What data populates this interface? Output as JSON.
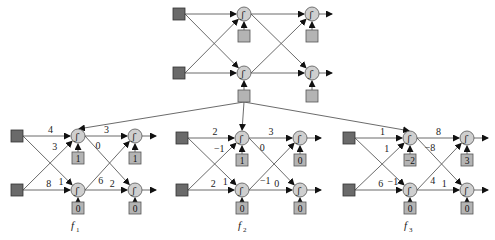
{
  "colors": {
    "edge": "#5a5a5a",
    "input_node": "#6a6a6a",
    "bias_node": "#b4b4b4",
    "neuron": "#cfcfcf",
    "arrow": "#111111"
  },
  "top_network": {
    "inputs": [
      {
        "x": 179,
        "y": 14
      },
      {
        "x": 179,
        "y": 73
      }
    ],
    "layer1": [
      {
        "x": 244,
        "y": 14
      },
      {
        "x": 244,
        "y": 73
      }
    ],
    "layer2": [
      {
        "x": 312,
        "y": 14
      },
      {
        "x": 312,
        "y": 73
      }
    ],
    "bias_l1": [
      {
        "x": 244,
        "y": 36,
        "label": ""
      },
      {
        "x": 244,
        "y": 96,
        "label": ""
      }
    ],
    "bias_l2": [
      {
        "x": 312,
        "y": 36,
        "label": ""
      },
      {
        "x": 312,
        "y": 96,
        "label": ""
      }
    ],
    "output_end_x": 332
  },
  "fanout_source": {
    "x": 244,
    "y": 96
  },
  "networks": [
    {
      "name": "f",
      "sub": "1",
      "label_pos": {
        "x": 74,
        "y": 229
      },
      "inputs": [
        {
          "x": 17,
          "y": 136
        },
        {
          "x": 17,
          "y": 190
        }
      ],
      "layer1": [
        {
          "x": 78,
          "y": 136
        },
        {
          "x": 78,
          "y": 190
        }
      ],
      "layer2": [
        {
          "x": 135,
          "y": 136
        },
        {
          "x": 135,
          "y": 190
        }
      ],
      "output_end_x": 156,
      "weights_in": {
        "w11": "4",
        "w21": "3",
        "w12": "1",
        "w22": "8"
      },
      "weights_hidden": {
        "w11": "3",
        "w12": "0",
        "w21": "6",
        "w22": "2"
      },
      "bias_l1": [
        "1",
        "0"
      ],
      "bias_l2": [
        "1",
        "0"
      ]
    },
    {
      "name": "f",
      "sub": "2",
      "label_pos": {
        "x": 241,
        "y": 229
      },
      "inputs": [
        {
          "x": 182,
          "y": 138
        },
        {
          "x": 182,
          "y": 190
        }
      ],
      "layer1": [
        {
          "x": 242,
          "y": 138
        },
        {
          "x": 242,
          "y": 190
        }
      ],
      "layer2": [
        {
          "x": 300,
          "y": 138
        },
        {
          "x": 300,
          "y": 190
        }
      ],
      "output_end_x": 321,
      "weights_in": {
        "w11": "2",
        "w21": "−1",
        "w12": "1",
        "w22": "2"
      },
      "weights_hidden": {
        "w11": "3",
        "w12": "0",
        "w21": "−1",
        "w22": "0"
      },
      "bias_l1": [
        "1",
        "0"
      ],
      "bias_l2": [
        "0",
        "0"
      ]
    },
    {
      "name": "f",
      "sub": "3",
      "label_pos": {
        "x": 407,
        "y": 229
      },
      "inputs": [
        {
          "x": 349,
          "y": 138
        },
        {
          "x": 349,
          "y": 190
        }
      ],
      "layer1": [
        {
          "x": 410,
          "y": 138
        },
        {
          "x": 410,
          "y": 190
        }
      ],
      "layer2": [
        {
          "x": 467,
          "y": 138
        },
        {
          "x": 467,
          "y": 190
        }
      ],
      "output_end_x": 488,
      "weights_in": {
        "w11": "1",
        "w21": "1",
        "w12": "−1",
        "w22": "6"
      },
      "weights_hidden": {
        "w11": "8",
        "w12": "−8",
        "w21": "4",
        "w22": "1"
      },
      "bias_l1": [
        "−2",
        "0"
      ],
      "bias_l2": [
        "3",
        "0"
      ]
    }
  ],
  "neuron_glyph": "ʃ"
}
